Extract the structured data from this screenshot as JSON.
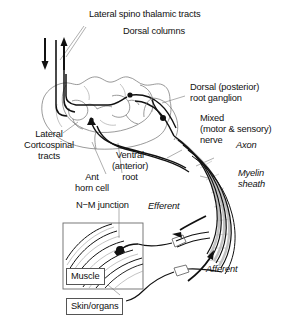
{
  "diagram": {
    "labels": {
      "lateral_spinothalamic": "Lateral spino thalamic tracts",
      "dorsal_columns": "Dorsal columns",
      "dorsal_root_ganglion": "Dorsal (posterior)\nroot ganglion",
      "mixed_nerve": "Mixed\n(motor & sensory)\nnerve",
      "axon": "Axon",
      "myelin_sheath": "Myelin\nsheath",
      "lateral_corticospinal": "Lateral\nCortcospinal\ntracts",
      "ant_horn_cell": "Ant\nhorn cell",
      "ventral_root": "Ventral\n(anterior)\nroot",
      "nm_junction": "N−M junction",
      "efferent": "Efferent",
      "afferent": "Afferent",
      "muscle": "Muscle",
      "skin_organs": "Skin/organs"
    },
    "arrows": {
      "descending_tract_direction": "down",
      "ascending_tract_direction": "up",
      "efferent_direction": "down-left",
      "afferent_direction": "up-right"
    },
    "colors": {
      "ink": "#111111",
      "light_outline": "#6f6f6f",
      "myelin_gray": "#c2c2c2",
      "leader": "#8d8d8d",
      "box_border": "#6a6a6a",
      "background": "#ffffff"
    }
  }
}
